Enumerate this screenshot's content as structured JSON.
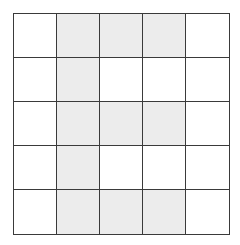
{
  "grid": {
    "rows": 5,
    "cols": 5,
    "shaded_color": "#ececec",
    "line_color": "#3a3a3a",
    "cells": [
      [
        0,
        1,
        1,
        1,
        0
      ],
      [
        0,
        1,
        0,
        0,
        0
      ],
      [
        0,
        1,
        1,
        1,
        0
      ],
      [
        0,
        1,
        0,
        0,
        0
      ],
      [
        0,
        1,
        1,
        1,
        0
      ]
    ]
  }
}
